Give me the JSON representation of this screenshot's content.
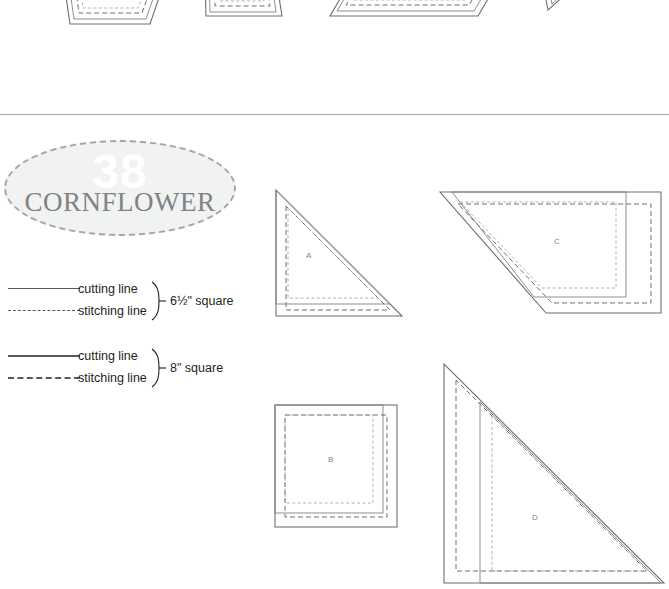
{
  "page": {
    "background_color": "#ffffff",
    "width": 669,
    "height": 589
  },
  "badge": {
    "number": "38",
    "name": "CORNFLOWER",
    "fill_color": "#f1f2f2",
    "border_color": "#a3a5a8",
    "number_color": "#ffffff",
    "name_color": "#808285"
  },
  "legends": [
    {
      "id": "legend-6-5",
      "cutting_label": "cutting line",
      "stitching_label": "stitching line",
      "size_label": "6½\" square"
    },
    {
      "id": "legend-8",
      "cutting_label": "cutting line",
      "stitching_label": "stitching line",
      "size_label": "8\" square"
    }
  ],
  "templates_top_partial": [
    {
      "id": "top-c",
      "label": "C",
      "shape": "trapezoid"
    },
    {
      "id": "top-d",
      "label": "D",
      "shape": "quadrilateral"
    },
    {
      "id": "top-e",
      "label": "E",
      "shape": "parallelogram"
    },
    {
      "id": "top-f",
      "label": "",
      "shape": "triangle-tip"
    }
  ],
  "templates_main": [
    {
      "id": "piece-a",
      "label": "A",
      "shape": "right-triangle"
    },
    {
      "id": "piece-c",
      "label": "C",
      "shape": "beveled-pentagon"
    },
    {
      "id": "piece-b",
      "label": "B",
      "shape": "square"
    },
    {
      "id": "piece-d",
      "label": "D",
      "shape": "large-right-triangle"
    }
  ],
  "line_styles": {
    "cutting_8_color": "#6d6e71",
    "cutting_6_5_color": "#808285",
    "stitching_8_color": "#6d6e71",
    "stitching_6_5_color": "#a7a9ac",
    "divider_color": "#a7a9ac"
  }
}
